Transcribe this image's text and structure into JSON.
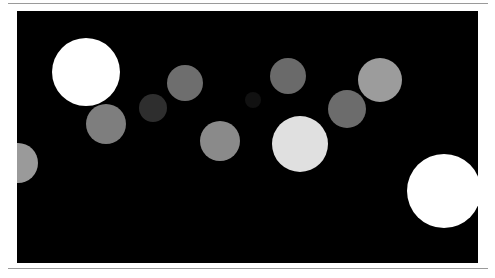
{
  "image": {
    "background": "#000000",
    "frame_color": "#ffffff",
    "rule_color": "#9a9a9a",
    "circles": [
      {
        "cx": 86,
        "cy": 72,
        "r": 34,
        "color": "#ffffff"
      },
      {
        "cx": 185,
        "cy": 83,
        "r": 18,
        "color": "#6e6e6e"
      },
      {
        "cx": 153,
        "cy": 108,
        "r": 14,
        "color": "#2e2e2e"
      },
      {
        "cx": 106,
        "cy": 124,
        "r": 20,
        "color": "#7e7e7e"
      },
      {
        "cx": 220,
        "cy": 141,
        "r": 20,
        "color": "#8a8a8a"
      },
      {
        "cx": 253,
        "cy": 100,
        "r": 8,
        "color": "#111111"
      },
      {
        "cx": 288,
        "cy": 76,
        "r": 18,
        "color": "#6a6a6a"
      },
      {
        "cx": 380,
        "cy": 80,
        "r": 22,
        "color": "#9c9c9c"
      },
      {
        "cx": 347,
        "cy": 109,
        "r": 19,
        "color": "#6c6c6c"
      },
      {
        "cx": 300,
        "cy": 144,
        "r": 28,
        "color": "#e0e0e0"
      },
      {
        "cx": 18,
        "cy": 163,
        "r": 20,
        "color": "#9a9a9a"
      },
      {
        "cx": 444,
        "cy": 191,
        "r": 37,
        "color": "#ffffff"
      }
    ]
  }
}
